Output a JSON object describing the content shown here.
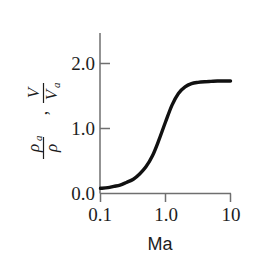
{
  "figure": {
    "background_color": "#ffffff",
    "ink_color": "#111111",
    "axis_color": "#6f6f6f"
  },
  "axes": {
    "y_label_parts": {
      "rho_a": "ρ",
      "rho_a_sub": "a",
      "rho": "ρ",
      "separator": ",",
      "V": "V",
      "V_a": "V",
      "V_a_sub": "a"
    },
    "x_title": "Ma",
    "x_tick_labels": [
      "0.1",
      "1.0",
      "10"
    ],
    "y_tick_labels": [
      "0.0",
      "1.0",
      "2.0"
    ]
  },
  "chart_data": {
    "type": "line",
    "title": "",
    "xlabel": "Ma",
    "ylabel": "ρa/ρ , V/Va",
    "xscale": "log",
    "yscale": "linear",
    "xlim": [
      0.1,
      10
    ],
    "ylim": [
      0.0,
      2.2
    ],
    "xticks": [
      0.1,
      1.0,
      10
    ],
    "xticklabels": [
      "0.1",
      "1.0",
      "10"
    ],
    "yticks": [
      0.0,
      1.0,
      2.0
    ],
    "yticklabels": [
      "0.0",
      "1.0",
      "2.0"
    ],
    "grid": false,
    "legend": "none",
    "series": [
      {
        "name": "ρa/ρ , V/Va",
        "color": "#111111",
        "linewidth": 3.4,
        "x": [
          0.1,
          0.13,
          0.16,
          0.2,
          0.25,
          0.32,
          0.4,
          0.5,
          0.63,
          0.79,
          1.0,
          1.26,
          1.58,
          2.0,
          2.51,
          3.16,
          3.98,
          5.01,
          6.31,
          7.94,
          10.0
        ],
        "y": [
          0.08,
          0.09,
          0.11,
          0.13,
          0.17,
          0.22,
          0.3,
          0.41,
          0.58,
          0.82,
          1.1,
          1.36,
          1.54,
          1.64,
          1.69,
          1.71,
          1.72,
          1.725,
          1.73,
          1.73,
          1.73
        ]
      }
    ],
    "annotations": []
  }
}
